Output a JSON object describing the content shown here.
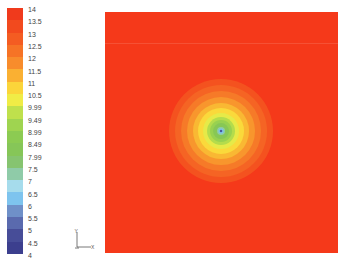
{
  "chart_data": {
    "type": "heatmap",
    "subtype": "filled-contour",
    "title": "",
    "xlabel": "X",
    "ylabel": "Y",
    "colorbar": {
      "levels": [
        14,
        13.5,
        13,
        12.5,
        12,
        11.5,
        11,
        10.5,
        9.99,
        9.49,
        8.99,
        8.49,
        7.99,
        7.5,
        7,
        6.5,
        6,
        5.5,
        5,
        4.5,
        4
      ],
      "labels": [
        "14",
        "13.5",
        "13",
        "12.5",
        "12",
        "11.5",
        "11",
        "10.5",
        "9.99",
        "9.49",
        "8.99",
        "8.49",
        "7.99",
        "7.5",
        "7",
        "6.5",
        "6",
        "5.5",
        "5",
        "4.5",
        "4"
      ],
      "colors": [
        "#f03a1c",
        "#f24a1e",
        "#f45c22",
        "#f67326",
        "#f88c2c",
        "#fab032",
        "#fbd53a",
        "#f0ec46",
        "#bfe04c",
        "#9fd450",
        "#8ccb52",
        "#86c658",
        "#86c470",
        "#8fcba8",
        "#a6dcec",
        "#7ec4ee",
        "#6f90c8",
        "#5a6aae",
        "#474d98",
        "#3c3f8e",
        "#363888"
      ]
    },
    "field": {
      "background_value": 14,
      "background_color": "#f5391a",
      "center": {
        "x_frac": 0.498,
        "y_frac": 0.494
      },
      "min_value_at_center": 6.0,
      "contour_rings": [
        {
          "level": 13.5,
          "radius_px": 52,
          "color": "#f4521f"
        },
        {
          "level": 13,
          "radius_px": 46,
          "color": "#f56424"
        },
        {
          "level": 12.5,
          "radius_px": 40,
          "color": "#f67a28"
        },
        {
          "level": 12,
          "radius_px": 34,
          "color": "#f8962d"
        },
        {
          "level": 11.5,
          "radius_px": 28,
          "color": "#f9b833"
        },
        {
          "level": 11,
          "radius_px": 23,
          "color": "#fad93b"
        },
        {
          "level": 10.5,
          "radius_px": 18,
          "color": "#e6ea48"
        },
        {
          "level": 9.99,
          "radius_px": 14,
          "color": "#b4dc4c"
        },
        {
          "level": 9.49,
          "radius_px": 11,
          "color": "#98d150"
        },
        {
          "level": 8.99,
          "radius_px": 8,
          "color": "#87c755"
        },
        {
          "level": 7.5,
          "radius_px": 4,
          "color": "#8fcba8"
        },
        {
          "level": 6.5,
          "radius_px": 2.5,
          "color": "#7ec4ee"
        },
        {
          "level": 6,
          "radius_px": 1.3,
          "color": "#4a5a9c"
        }
      ]
    },
    "grid": false,
    "legend_position": "left"
  },
  "axes_triad": {
    "x_label": "X",
    "y_label": "Y"
  }
}
